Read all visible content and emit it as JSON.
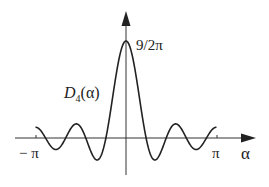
{
  "chart_data": {
    "type": "line",
    "title": "",
    "function": "D_4(alpha) = sin(9*alpha/2) / (2*pi*sin(alpha/2))",
    "n": 4,
    "xlabel": "α",
    "ylabel": "",
    "curve_label": "D",
    "curve_label_sub": "4",
    "curve_label_arg": "(α)",
    "peak_label": "9/2π",
    "peak_value": 1.4324,
    "x_tick_labels": [
      "− π",
      "π"
    ],
    "xlim": [
      -3.14159,
      3.14159
    ],
    "grid": false,
    "legend": "none",
    "series": [
      {
        "name": "D_4(α)",
        "x": [
          -3.1416,
          -2.7925,
          -2.0944,
          -1.3963,
          -0.6981,
          0,
          0.6981,
          1.3963,
          2.0944,
          2.7925,
          3.1416
        ],
        "values": [
          0.1592,
          0.0,
          0.0,
          0.0,
          0.0,
          1.4324,
          0.0,
          0.0,
          0.0,
          0.0,
          0.1592
        ]
      }
    ],
    "extrema": [
      {
        "x": -2.4435,
        "y": -0.167
      },
      {
        "x": -1.7453,
        "y": 0.198
      },
      {
        "x": -1.0472,
        "y": -0.318
      },
      {
        "x": 0,
        "y": 1.4324
      },
      {
        "x": 1.0472,
        "y": -0.318
      },
      {
        "x": 1.7453,
        "y": 0.198
      },
      {
        "x": 2.4435,
        "y": -0.167
      }
    ]
  },
  "colors": {
    "curve": "#222222",
    "axis": "#333333",
    "background": "#ffffff"
  }
}
